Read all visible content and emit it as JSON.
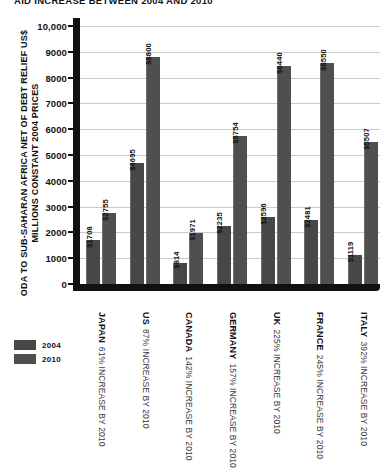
{
  "chart_data": {
    "type": "bar",
    "title": "AID INCREASE BETWEEN 2004 AND 2010",
    "ylabel": "ODA TO SUB-SAHARAN AFRICA NET OF DEBT RELIEF US$ MILLIONS CONSTANT 2004 PRICES",
    "xlabel": "",
    "ylim": [
      0,
      10000
    ],
    "grid": true,
    "legend_position": "bottom-left",
    "categories": [
      "JAPAN",
      "US",
      "CANADA",
      "GERMANY",
      "UK",
      "FRANCE",
      "ITALY"
    ],
    "tick_labels": [
      "10,000",
      "9000",
      "8000",
      "7000",
      "6000",
      "5000",
      "4000",
      "3000",
      "2000",
      "1000",
      "0"
    ],
    "tick_values": [
      10000,
      9000,
      8000,
      7000,
      6000,
      5000,
      4000,
      3000,
      2000,
      1000,
      0
    ],
    "series": [
      {
        "name": "2004",
        "color": "#474747",
        "values": [
          1708,
          4695,
          814,
          2235,
          2596,
          2481,
          1119
        ],
        "labels": [
          "$1708",
          "$4695",
          "$814",
          "$2235",
          "$2596",
          "$2481",
          "$1119"
        ]
      },
      {
        "name": "2010",
        "color": "#4f4f4f",
        "values": [
          2755,
          8800,
          1971,
          5754,
          8440,
          8550,
          5507
        ],
        "labels": [
          "$2755",
          "$8800",
          "$1971",
          "$5754",
          "$8440",
          "$8550",
          "$5507"
        ]
      }
    ],
    "annotations": [
      "61% INCREASE BY 2010",
      "87% INCREASE BY 2010",
      "142% INCREASE BY 2010",
      "157% INCREASE BY 2010",
      "225% INCREASE BY 2010",
      "245% INCREASE BY 2010",
      "392% INCREASE BY 2010"
    ],
    "category_increases": [
      "61%",
      "87%",
      "142%",
      "157%",
      "225%",
      "245%",
      "392%"
    ],
    "increase_suffix": "INCREASE BY 2010"
  },
  "legend": {
    "items": [
      {
        "label": "2004",
        "color": "#474747"
      },
      {
        "label": "2010",
        "color": "#4f4f4f"
      }
    ]
  }
}
